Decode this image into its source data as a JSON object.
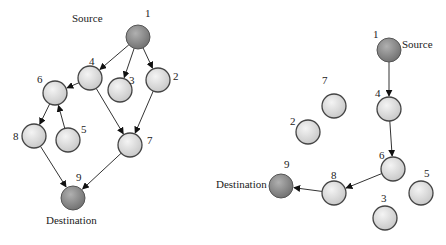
{
  "graphs": [
    {
      "name": "left-graph",
      "source_label": "Source",
      "destination_label": "Destination",
      "nodes": [
        {
          "id": "1",
          "x": 138,
          "y": 37,
          "dark": true,
          "lx": 145,
          "ly": 17
        },
        {
          "id": "4",
          "x": 90,
          "y": 78,
          "dark": false,
          "lx": 89,
          "ly": 65
        },
        {
          "id": "3",
          "x": 120,
          "y": 90,
          "dark": false,
          "lx": 129,
          "ly": 84
        },
        {
          "id": "2",
          "x": 158,
          "y": 80,
          "dark": false,
          "lx": 173,
          "ly": 80
        },
        {
          "id": "6",
          "x": 55,
          "y": 93,
          "dark": false,
          "lx": 37,
          "ly": 83
        },
        {
          "id": "8",
          "x": 34,
          "y": 136,
          "dark": false,
          "lx": 13,
          "ly": 140
        },
        {
          "id": "5",
          "x": 68,
          "y": 140,
          "dark": false,
          "lx": 81,
          "ly": 133
        },
        {
          "id": "7",
          "x": 130,
          "y": 145,
          "dark": false,
          "lx": 147,
          "ly": 144
        },
        {
          "id": "9",
          "x": 73,
          "y": 198,
          "dark": true,
          "lx": 76,
          "ly": 181
        }
      ],
      "edges": [
        [
          "1",
          "4"
        ],
        [
          "1",
          "3"
        ],
        [
          "1",
          "2"
        ],
        [
          "4",
          "6"
        ],
        [
          "4",
          "7"
        ],
        [
          "2",
          "7"
        ],
        [
          "6",
          "8"
        ],
        [
          "5",
          "6"
        ],
        [
          "8",
          "9"
        ],
        [
          "7",
          "9"
        ]
      ]
    },
    {
      "name": "right-graph",
      "source_label": "Source",
      "destination_label": "Destination",
      "nodes": [
        {
          "id": "1",
          "x": 389,
          "y": 50,
          "dark": true,
          "lx": 373,
          "ly": 38
        },
        {
          "id": "4",
          "x": 389,
          "y": 109,
          "dark": false,
          "lx": 375,
          "ly": 97
        },
        {
          "id": "7",
          "x": 334,
          "y": 106,
          "dark": false,
          "lx": 322,
          "ly": 84
        },
        {
          "id": "2",
          "x": 308,
          "y": 132,
          "dark": false,
          "lx": 290,
          "ly": 125
        },
        {
          "id": "6",
          "x": 393,
          "y": 169,
          "dark": false,
          "lx": 379,
          "ly": 159
        },
        {
          "id": "5",
          "x": 421,
          "y": 193,
          "dark": false,
          "lx": 424,
          "ly": 177
        },
        {
          "id": "8",
          "x": 334,
          "y": 193,
          "dark": false,
          "lx": 331,
          "ly": 179
        },
        {
          "id": "3",
          "x": 385,
          "y": 218,
          "dark": false,
          "lx": 381,
          "ly": 202
        },
        {
          "id": "9",
          "x": 281,
          "y": 186,
          "dark": true,
          "lx": 284,
          "ly": 168
        }
      ],
      "edges": [
        [
          "1",
          "4"
        ],
        [
          "4",
          "6"
        ],
        [
          "6",
          "8"
        ],
        [
          "8",
          "9"
        ]
      ]
    }
  ],
  "labels": {
    "left_source": "Source",
    "left_destination": "Destination",
    "right_source": "Source",
    "right_destination": "Destination"
  },
  "colors": {
    "light_node_fill": "#dcdcdc",
    "dark_node_fill": "#8a8a8a",
    "edge": "#333333"
  }
}
